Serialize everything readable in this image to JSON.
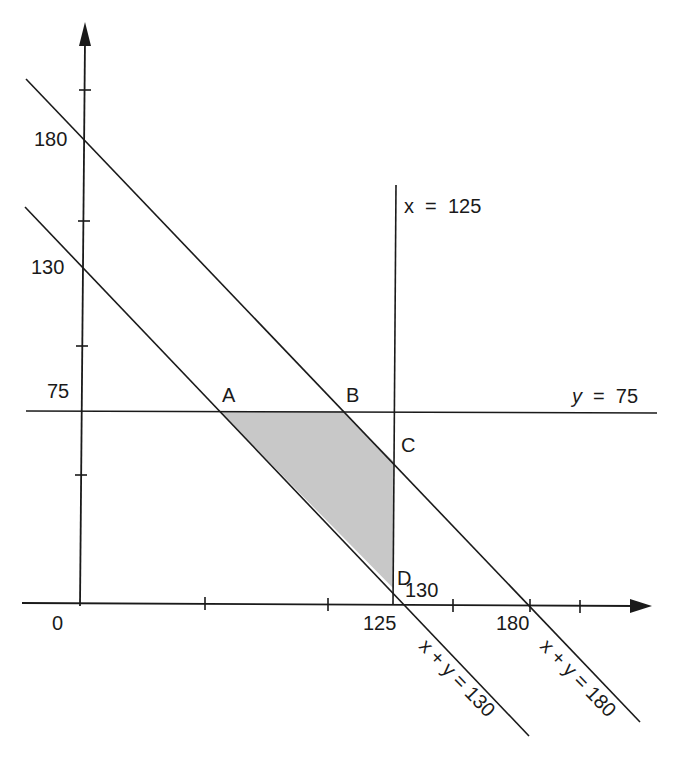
{
  "diagram": {
    "colors": {
      "ink": "#1a1a1a",
      "shade": "#c8c8c8",
      "background": "#ffffff"
    },
    "axes": {
      "origin_label": "0",
      "x_ticks_labeled": [
        "125",
        "180"
      ],
      "y_ticks_labeled": [
        "180",
        "130",
        "75"
      ],
      "x_extra_label": "130"
    },
    "lines": [
      {
        "id": "x125",
        "label": "x  =  125"
      },
      {
        "id": "y75",
        "label_var": "y",
        "label_eq": "=",
        "label_val": "75"
      },
      {
        "id": "sum130",
        "label": "x + y = 130"
      },
      {
        "id": "sum180",
        "label": "x + y = 180"
      }
    ],
    "points": [
      {
        "name": "A",
        "x": 55,
        "y": 75
      },
      {
        "name": "B",
        "x": 105,
        "y": 75
      },
      {
        "name": "C",
        "x": 125,
        "y": 55
      },
      {
        "name": "D",
        "x": 125,
        "y": 5
      }
    ],
    "region": "shaded quadrilateral ABCD"
  },
  "labels": {
    "origin": "0",
    "y180": "180",
    "y130": "130",
    "y75": "75",
    "x125": "125",
    "x130": "130",
    "x180": "180",
    "line_x125": "x  =  125",
    "line_y75_var": "y",
    "line_y75_rest": "=  75",
    "line_sum130": "x + y = 130",
    "line_sum180": "x + y = 180",
    "pA": "A",
    "pB": "B",
    "pC": "C",
    "pD": "D"
  }
}
